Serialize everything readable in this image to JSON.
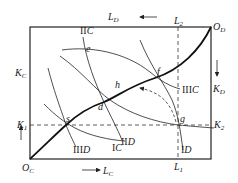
{
  "diagram": {
    "type": "edgeworth-box-production",
    "origins": {
      "bottom_left": "O_C",
      "top_right": "O_D"
    },
    "axes": {
      "bottom": {
        "label": "L",
        "sub": "C",
        "direction": "right"
      },
      "left": {
        "label": "K",
        "sub": "C",
        "direction": "up"
      },
      "top": {
        "label": "L",
        "sub": "D",
        "direction": "left"
      },
      "right": {
        "label": "K",
        "sub": "D",
        "direction": "down"
      }
    },
    "reference_lines": {
      "vertical": {
        "top_label": "L",
        "top_sub": "2",
        "bottom_label": "L",
        "bottom_sub": "1"
      },
      "horizontal": {
        "left_label": "K",
        "left_sub": "1",
        "right_label": "K",
        "right_sub": "2"
      }
    },
    "isoquants_C": [
      {
        "label": "IC"
      },
      {
        "label": "IIC"
      },
      {
        "label": "IIIC"
      }
    ],
    "isoquants_D": [
      {
        "label": "ID"
      },
      {
        "label": "IID"
      },
      {
        "label": "IIID"
      }
    ],
    "points": [
      "s",
      "d",
      "h",
      "f",
      "e",
      "g"
    ],
    "contract_curve": "O_C – s – d – h – f – O_D",
    "colors": {
      "line": "#222222",
      "background": "#ffffff"
    }
  },
  "labels": {
    "OC": "O",
    "OC_sub": "C",
    "OD": "O",
    "OD_sub": "D",
    "LC": "L",
    "LC_sub": "C",
    "KC": "K",
    "KC_sub": "C",
    "LD": "L",
    "LD_sub": "D",
    "KD": "K",
    "KD_sub": "D",
    "L1": "L",
    "L1_sub": "1",
    "L2": "L",
    "L2_sub": "2",
    "K1": "K",
    "K1_sub": "1",
    "K2": "K",
    "K2_sub": "2",
    "IC": "IC",
    "IIC_roman": "II",
    "IIC_letter": "C",
    "IIIC_roman": "III",
    "IIIC_letter": "C",
    "ID_roman": "I",
    "ID_letter": "D",
    "IID_roman": "II",
    "IID_letter": "D",
    "IIID_roman": "III",
    "IIID_letter": "D",
    "IC_roman": "I",
    "IC_letter": "C",
    "s": "s",
    "d": "d",
    "h": "h",
    "f": "f",
    "e": "e",
    "g": "g"
  }
}
